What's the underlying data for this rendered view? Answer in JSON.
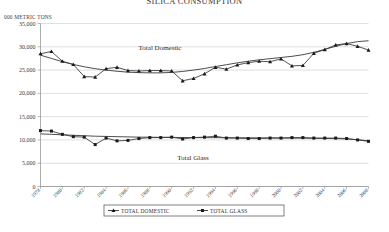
{
  "chart_data": {
    "type": "line",
    "title": "SILICA CONSUMPTION",
    "ylabel": "000 METRIC TONS",
    "xlabel": "",
    "ylim": [
      0,
      35000
    ],
    "ytick_step": 5000,
    "yticks": [
      "0",
      "5,000",
      "10,000",
      "15,000",
      "20,000",
      "25,000",
      "30,000",
      "35,000"
    ],
    "grid": true,
    "legend_position": "bottom",
    "x": [
      1978,
      1979,
      1980,
      1981,
      1982,
      1983,
      1984,
      1985,
      1986,
      1987,
      1988,
      1989,
      1990,
      1991,
      1992,
      1993,
      1994,
      1995,
      1996,
      1997,
      1998,
      1999,
      2000,
      2001,
      2002,
      2003,
      2004,
      2005,
      2006,
      2007,
      2008
    ],
    "xtick_labels": [
      "1978",
      "1980",
      "1982",
      "1984",
      "1986",
      "1988",
      "1990",
      "1992",
      "1994",
      "1996",
      "1998",
      "2000",
      "2002",
      "2004",
      "2006",
      "2008"
    ],
    "series": [
      {
        "name": "TOTAL DOMESTIC",
        "label_in_chart": "Total Domestic",
        "color": "#1a1a1a",
        "marker": "triangle",
        "values": [
          28500,
          29000,
          26900,
          26200,
          23600,
          23500,
          25300,
          25600,
          24900,
          24800,
          24900,
          24900,
          24800,
          22700,
          23200,
          24200,
          25600,
          25200,
          26100,
          26600,
          26900,
          26800,
          27400,
          25900,
          26000,
          28600,
          29400,
          30400,
          30700,
          30100,
          29300
        ],
        "trend": [
          28200,
          27500,
          26800,
          26200,
          25700,
          25300,
          25000,
          24750,
          24550,
          24450,
          24400,
          24400,
          24500,
          24700,
          25000,
          25350,
          25750,
          26150,
          26550,
          26900,
          27200,
          27450,
          27700,
          27950,
          28300,
          28800,
          29450,
          30100,
          30700,
          31100,
          31300
        ]
      },
      {
        "name": "TOTAL GLASS",
        "label_in_chart": "Total Glass",
        "color": "#1a1a1a",
        "marker": "square",
        "values": [
          12000,
          11900,
          11200,
          10700,
          10600,
          9000,
          10400,
          9800,
          9900,
          10300,
          10500,
          10500,
          10600,
          10200,
          10500,
          10600,
          10800,
          10400,
          10400,
          10300,
          10300,
          10400,
          10400,
          10500,
          10500,
          10400,
          10400,
          10400,
          10300,
          10000,
          9700
        ],
        "trend": [
          11300,
          11200,
          11100,
          11000,
          10900,
          10800,
          10750,
          10700,
          10650,
          10600,
          10580,
          10560,
          10540,
          10520,
          10500,
          10490,
          10480,
          10470,
          10460,
          10450,
          10440,
          10430,
          10420,
          10400,
          10380,
          10350,
          10320,
          10280,
          10220,
          10050,
          9800
        ]
      }
    ]
  }
}
